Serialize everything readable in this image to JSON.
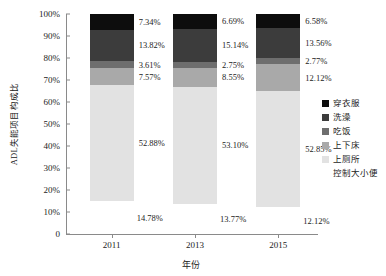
{
  "chart_data": {
    "type": "bar",
    "stacked": true,
    "title": "",
    "subtitle": "",
    "xlabel": "年份",
    "ylabel": "ADL失能项目构成比",
    "categories": [
      "2011",
      "2013",
      "2015"
    ],
    "ylim": [
      0,
      100
    ],
    "ytick_labels": [
      "0",
      "10%",
      "20%",
      "30%",
      "40%",
      "50%",
      "60%",
      "70%",
      "80%",
      "90%",
      "100%"
    ],
    "ytick_values": [
      0,
      10,
      20,
      30,
      40,
      50,
      60,
      70,
      80,
      90,
      100
    ],
    "grid": false,
    "legend_position": "right",
    "series": [
      {
        "name": "穿衣服",
        "color": "#0d0d0d",
        "values": [
          7.34,
          6.69,
          6.58
        ],
        "labels": [
          "7.34%",
          "6.69%",
          "6.58%"
        ]
      },
      {
        "name": "洗澡",
        "color": "#3c3c3c",
        "values": [
          13.82,
          15.14,
          13.56
        ],
        "labels": [
          "13.82%",
          "15.14%",
          "13.56%"
        ]
      },
      {
        "name": "吃饭",
        "color": "#6e6e6e",
        "values": [
          3.61,
          2.75,
          2.77
        ],
        "labels": [
          "3.61%",
          "2.75%",
          "2.77%"
        ]
      },
      {
        "name": "上下床",
        "color": "#a9a9a9",
        "values": [
          7.57,
          8.55,
          12.12
        ],
        "labels": [
          "7.57%",
          "8.55%",
          "12.12%"
        ]
      },
      {
        "name": "上厕所",
        "color": "#e2e2e2",
        "values": [
          52.88,
          53.1,
          52.85
        ],
        "labels": [
          "52.88%",
          "53.10%",
          "52.85%"
        ]
      },
      {
        "name": "控制大小便",
        "color": "#ffffff",
        "values": [
          14.78,
          13.77,
          12.12
        ],
        "labels": [
          "14.78%",
          "13.77%",
          "12.12%"
        ]
      }
    ]
  }
}
